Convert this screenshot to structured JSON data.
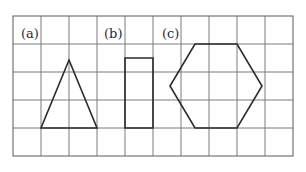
{
  "figure": {
    "grid": {
      "columns": 10,
      "rows": 5,
      "cell_size": 28,
      "origin": [
        13,
        16
      ],
      "line_color": "#7a7a7a"
    },
    "shapes": [
      {
        "label": "(a)",
        "type": "isosceles-triangle",
        "label_pos": [
          21,
          38
        ],
        "points": [
          [
            69,
            60
          ],
          [
            97,
            128
          ],
          [
            41,
            128
          ]
        ]
      },
      {
        "label": "(b)",
        "type": "rectangle",
        "label_pos": [
          104,
          38
        ],
        "points": [
          [
            125,
            58
          ],
          [
            153,
            58
          ],
          [
            153,
            128
          ],
          [
            125,
            128
          ]
        ]
      },
      {
        "label": "(c)",
        "type": "hexagon",
        "label_pos": [
          162,
          38
        ],
        "points": [
          [
            195,
            44
          ],
          [
            237,
            44
          ],
          [
            262,
            86
          ],
          [
            237,
            128
          ],
          [
            195,
            128
          ],
          [
            170,
            86
          ]
        ]
      }
    ],
    "stroke_color": "#2b2b2b"
  }
}
